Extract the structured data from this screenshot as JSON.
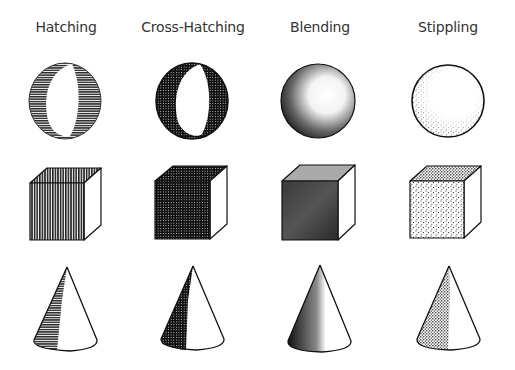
{
  "columns": [
    {
      "label": "Hatching",
      "center_x": 65
    },
    {
      "label": "Cross-Hatching",
      "center_x": 192
    },
    {
      "label": "Blending",
      "center_x": 320
    },
    {
      "label": "Stippling",
      "center_x": 448
    }
  ],
  "rows": [
    "sphere",
    "cube",
    "cone"
  ],
  "colors": {
    "ink": "#1a1a1a",
    "paper": "#ffffff",
    "label": "#333333"
  }
}
